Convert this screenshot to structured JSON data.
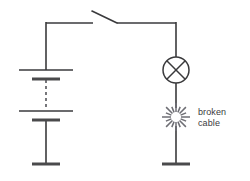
{
  "diagram": {
    "type": "electrical-circuit-schematic",
    "background_color": "#ffffff",
    "line_color": "#3a3a3c",
    "accent_color": "#6e6e74"
  },
  "annotations": {
    "broken_cable_line1": "broken",
    "broken_cable_line2": "cable"
  },
  "components": {
    "battery": {
      "name": "battery",
      "x": 46,
      "symbol": "multi-cell-battery",
      "cells_indicated_by": "dashed-line",
      "plates": [
        {
          "kind": "long",
          "y": 70,
          "half_width": 27
        },
        {
          "kind": "short",
          "y": 79,
          "half_width": 14
        },
        {
          "kind": "long",
          "y": 111,
          "half_width": 27
        },
        {
          "kind": "short",
          "y": 120,
          "half_width": 14
        },
        {
          "kind": "short",
          "y": 164,
          "half_width": 14
        }
      ],
      "dashed_from_y": 80,
      "dashed_to_y": 110
    },
    "switch": {
      "name": "open-switch",
      "state": "open",
      "rail_y": 23,
      "left_contact_x": 93,
      "right_contact_x": 117,
      "lever_tip_x": 92,
      "lever_tip_y": 11
    },
    "lamp": {
      "name": "lamp",
      "symbol": "circle-with-cross",
      "cx": 176,
      "cy": 70,
      "r": 13
    },
    "break": {
      "name": "broken-cable-burst",
      "cx": 176,
      "cy": 117,
      "inner_radius": 5,
      "outer_radius": 14,
      "ray_count": 16
    }
  },
  "wires": {
    "top_left_rail": {
      "x1": 46,
      "y1": 23,
      "x2": 93,
      "y2": 23
    },
    "top_right_rail": {
      "x1": 117,
      "y1": 23,
      "x2": 176,
      "y2": 23
    },
    "left_vertical_upper": {
      "x": 46,
      "y1": 23,
      "y2": 70
    },
    "left_vertical_lower": {
      "x": 46,
      "y1": 120,
      "y2": 164
    },
    "right_vertical_upper": {
      "x": 176,
      "y1": 23,
      "y2": 57
    },
    "right_vertical_mid": {
      "x": 176,
      "y1": 83,
      "y2": 108
    },
    "right_vertical_lower": {
      "x": 176,
      "y1": 126,
      "y2": 164
    },
    "right_bottom_plate": {
      "y": 164,
      "x1": 162,
      "x2": 190
    }
  }
}
